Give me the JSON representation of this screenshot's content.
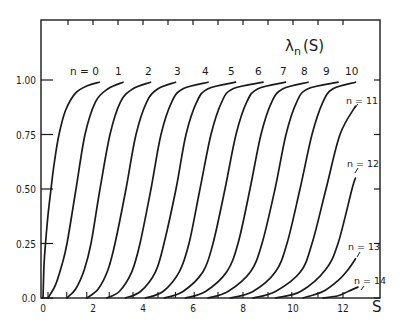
{
  "chart_data": {
    "type": "line",
    "title": "λn(S)",
    "title_main": "λ",
    "title_sub": "n",
    "title_arg": "(S)",
    "xlabel": "S",
    "ylabel": "",
    "xlim": [
      0,
      13.5
    ],
    "ylim": [
      0,
      1.2
    ],
    "grid": false,
    "legend": "inline curve labels",
    "x_ticks": [
      0,
      2,
      4,
      6,
      8,
      10,
      12
    ],
    "x_tick_labels": [
      "0",
      "2",
      "4",
      "6",
      "8",
      "10",
      "12"
    ],
    "y_ticks": [
      0.0,
      0.25,
      0.5,
      0.75,
      1.0
    ],
    "y_tick_labels": [
      "0.0",
      "0.25",
      "0.50",
      "0.75",
      "1.00"
    ],
    "top_minor_ticks": [
      1,
      2,
      3,
      4,
      5,
      6,
      7,
      8,
      9,
      10,
      11,
      12
    ],
    "series": [
      {
        "name": "n=0",
        "label": "n = 0",
        "x": [
          0.0,
          0.04,
          0.1,
          0.2,
          0.32,
          0.45,
          0.64,
          0.9,
          1.3,
          1.8,
          2.25
        ],
        "y": [
          0.0,
          0.15,
          0.25,
          0.38,
          0.5,
          0.62,
          0.75,
          0.86,
          0.94,
          0.975,
          0.99
        ]
      },
      {
        "name": "n=1",
        "label": "1",
        "x": [
          0.2,
          0.5,
          0.75,
          0.96,
          1.32,
          1.68,
          2.1,
          2.6,
          3.2
        ],
        "y": [
          0.0,
          0.06,
          0.15,
          0.25,
          0.5,
          0.75,
          0.9,
          0.96,
          0.99
        ]
      },
      {
        "name": "n=2",
        "label": "2",
        "x": [
          0.95,
          1.3,
          1.65,
          1.92,
          2.28,
          2.68,
          3.1,
          3.6,
          4.3
        ],
        "y": [
          0.0,
          0.04,
          0.13,
          0.25,
          0.5,
          0.75,
          0.9,
          0.96,
          0.99
        ]
      },
      {
        "name": "n=3",
        "label": "3",
        "x": [
          1.75,
          2.2,
          2.6,
          2.88,
          3.32,
          3.72,
          4.15,
          4.6,
          5.3
        ],
        "y": [
          0.0,
          0.04,
          0.13,
          0.25,
          0.5,
          0.75,
          0.9,
          0.96,
          0.99
        ]
      },
      {
        "name": "n=4",
        "label": "4",
        "x": [
          2.55,
          3.05,
          3.55,
          3.88,
          4.32,
          4.72,
          5.15,
          5.6,
          6.6
        ],
        "y": [
          0.0,
          0.03,
          0.12,
          0.25,
          0.5,
          0.75,
          0.9,
          0.96,
          0.99
        ]
      },
      {
        "name": "n=5",
        "label": "5",
        "x": [
          3.3,
          3.9,
          4.5,
          4.84,
          5.32,
          5.72,
          6.15,
          6.6,
          7.7
        ],
        "y": [
          0.0,
          0.03,
          0.12,
          0.25,
          0.5,
          0.75,
          0.9,
          0.96,
          0.99
        ]
      },
      {
        "name": "n=6",
        "label": "6",
        "x": [
          4.1,
          4.8,
          5.45,
          5.84,
          6.28,
          6.72,
          7.15,
          7.6,
          8.8
        ],
        "y": [
          0.0,
          0.03,
          0.12,
          0.25,
          0.5,
          0.75,
          0.9,
          0.96,
          0.99
        ]
      },
      {
        "name": "n=7",
        "label": "7",
        "x": [
          4.85,
          5.6,
          6.4,
          6.8,
          7.28,
          7.72,
          8.15,
          8.6,
          9.7
        ],
        "y": [
          0.0,
          0.03,
          0.12,
          0.25,
          0.5,
          0.75,
          0.9,
          0.96,
          0.99
        ]
      },
      {
        "name": "n=8",
        "label": "8",
        "x": [
          5.7,
          6.5,
          7.35,
          7.8,
          8.28,
          8.72,
          9.15,
          9.6,
          10.6
        ],
        "y": [
          0.0,
          0.03,
          0.12,
          0.25,
          0.5,
          0.75,
          0.9,
          0.96,
          0.99
        ]
      },
      {
        "name": "n=9",
        "label": "9",
        "x": [
          6.6,
          7.4,
          8.3,
          8.76,
          9.28,
          9.72,
          10.15,
          10.6,
          11.8
        ],
        "y": [
          0.0,
          0.03,
          0.12,
          0.25,
          0.5,
          0.75,
          0.9,
          0.96,
          0.99
        ]
      },
      {
        "name": "n=10",
        "label": "10",
        "x": [
          7.5,
          8.4,
          9.3,
          9.76,
          10.28,
          10.76,
          11.2,
          11.6,
          12.5
        ],
        "y": [
          0.0,
          0.03,
          0.12,
          0.25,
          0.5,
          0.75,
          0.9,
          0.96,
          0.99
        ]
      },
      {
        "name": "n=11",
        "label": "n = 11",
        "x": [
          8.4,
          9.3,
          10.3,
          10.76,
          11.32,
          11.88,
          12.5
        ],
        "y": [
          0.0,
          0.03,
          0.12,
          0.25,
          0.5,
          0.75,
          0.88
        ]
      },
      {
        "name": "n=12",
        "label": "n = 12",
        "x": [
          9.3,
          10.3,
          11.3,
          11.8,
          12.36,
          12.5
        ],
        "y": [
          0.0,
          0.03,
          0.13,
          0.25,
          0.5,
          0.55
        ]
      },
      {
        "name": "n=13",
        "label": "n = 13",
        "x": [
          10.4,
          11.2,
          11.8,
          12.2,
          12.5
        ],
        "y": [
          0.0,
          0.03,
          0.08,
          0.13,
          0.18
        ]
      },
      {
        "name": "n=14",
        "label": "n = 14",
        "x": [
          11.2,
          11.8,
          12.2,
          12.6
        ],
        "y": [
          0.0,
          0.01,
          0.03,
          0.05
        ]
      }
    ],
    "start_markers_S": [
      0.2,
      0.95,
      1.75,
      2.65,
      3.6,
      4.6,
      5.3,
      6.05,
      7.0,
      8.0,
      9.0,
      9.95,
      11.0,
      12.0
    ],
    "annotations": [
      {
        "text": "n = 0",
        "x": 1.8,
        "y": 1.02
      },
      {
        "text": "n = 11",
        "x": 12.4,
        "y": 0.92
      },
      {
        "text": "n = 12",
        "x": 12.4,
        "y": 0.58
      },
      {
        "text": "n = 13",
        "x": 12.4,
        "y": 0.22
      },
      {
        "text": "n = 14",
        "x": 12.4,
        "y": 0.08
      }
    ]
  },
  "labels": {
    "n0": "n = 0",
    "n1": "1",
    "n2": "2",
    "n3": "3",
    "n4": "4",
    "n5": "5",
    "n6": "6",
    "n7": "7",
    "n8": "8",
    "n9": "9",
    "n10": "10",
    "n11": "n = 11",
    "n12": "n = 12",
    "n13": "n = 13",
    "n14": "n = 14"
  }
}
